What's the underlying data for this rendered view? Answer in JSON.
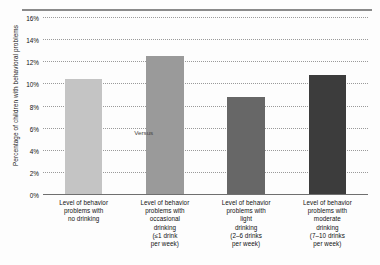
{
  "chart_data": {
    "type": "bar",
    "title": "",
    "subtitle": "",
    "xlabel": "",
    "ylabel": "Percentage of children with behavioral problems",
    "ylim": [
      0,
      16
    ],
    "ytick_labels": [
      "0%",
      "2%",
      "4%",
      "6%",
      "8%",
      "10%",
      "12%",
      "14%",
      "16%"
    ],
    "ytick_values": [
      0,
      2,
      4,
      6,
      8,
      10,
      12,
      14,
      16
    ],
    "grid": true,
    "legend": "none",
    "categories": [
      "Level of behavior problems with no drinking",
      "Level of behavior problems with occasional drinking (≤1 drink per week)",
      "Level of behavior problems with light drinking (2–6 drinks per week)",
      "Level of behavior problems with moderate drinking (7–10 drinks per week)"
    ],
    "category_lines": [
      [
        "Level of behavior",
        "problems with",
        "no drinking"
      ],
      [
        "Level of behavior",
        "problems with",
        "occasional",
        "drinking",
        "(≤1 drink",
        "per week)"
      ],
      [
        "Level of behavior",
        "problems with",
        "light",
        "drinking",
        "(2–6 drinks",
        "per week)"
      ],
      [
        "Level of behavior",
        "problems with",
        "moderate",
        "drinking",
        "(7–10 drinks",
        "per week)"
      ]
    ],
    "values": [
      10.4,
      12.5,
      8.8,
      10.8
    ],
    "bar_colors": [
      "#c4c4c4",
      "#9a9a9a",
      "#676767",
      "#3c3c3c"
    ],
    "annotations": [
      {
        "text": "Versus",
        "x_pct": 31,
        "y_value": 5.6
      }
    ]
  }
}
